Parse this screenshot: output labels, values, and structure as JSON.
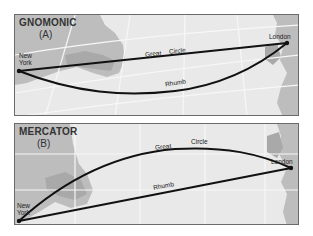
{
  "panels": [
    {
      "id": "A",
      "title": "GNOMONIC",
      "subtitle": "(A)",
      "labels": {
        "origin": [
          "New",
          "York"
        ],
        "destination": "London",
        "great_circle": [
          "Great",
          "Circle"
        ],
        "rhumb": "Rhumb"
      }
    },
    {
      "id": "B",
      "title": "MERCATOR",
      "subtitle": "(B)",
      "labels": {
        "origin": [
          "New",
          "York"
        ],
        "destination": "London",
        "great_circle": [
          "Great",
          "Circle"
        ],
        "rhumb": "Rhumb"
      }
    }
  ],
  "colors": {
    "sea": "#e9e9e9",
    "land": "#bdbdbd",
    "land_dark": "#a9a9a9",
    "grid": "#f7f7f7",
    "route": "#111111",
    "border": "#6a6a6a"
  }
}
